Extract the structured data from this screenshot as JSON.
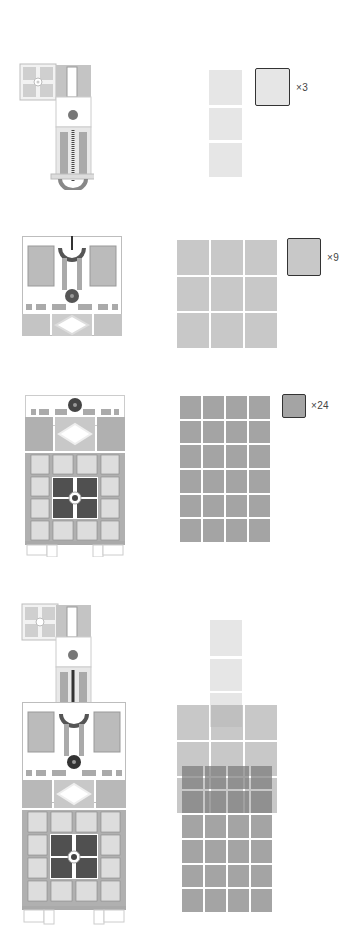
{
  "colors": {
    "background": "#ffffff",
    "light_tile": "#e6e6e6",
    "medium_tile": "#c8c8c8",
    "dark_tile": "#a4a4a4",
    "darkest_tile": "#8a8a8a",
    "plan_outline": "#bdbdbd",
    "plan_fill_mid": "#a9a9a9",
    "plan_fill_light": "#cfcfcf",
    "plan_fill_dark": "#555555",
    "legend_border": "#333333"
  },
  "panels": [
    {
      "id": "module-1",
      "legend": "×3",
      "count": 3,
      "grid": {
        "cols": 1,
        "rows": 3
      }
    },
    {
      "id": "module-2",
      "legend": "×9",
      "count": 9,
      "grid": {
        "cols": 3,
        "rows": 3
      }
    },
    {
      "id": "module-3",
      "legend": "×24",
      "count": 24,
      "grid": {
        "cols": 4,
        "rows": 6
      }
    },
    {
      "id": "combined",
      "legend": "",
      "count": 36,
      "grid": {
        "composition": [
          "1×3",
          "3×3",
          "4×6"
        ]
      }
    }
  ]
}
